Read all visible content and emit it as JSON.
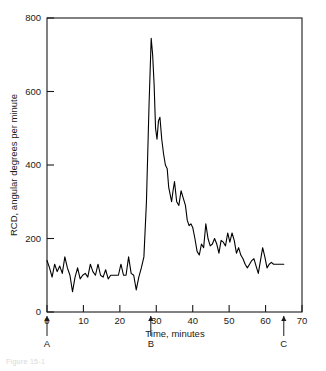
{
  "figure": {
    "caption_partial": "Figure 15-1"
  },
  "chart_data": {
    "type": "line",
    "title": "",
    "xlabel": "Time, minutes",
    "ylabel": "RCD, angular degrees per minute",
    "xlim": [
      0,
      70
    ],
    "ylim": [
      0,
      800
    ],
    "xticks": [
      0,
      10,
      20,
      30,
      40,
      50,
      60,
      70
    ],
    "yticks": [
      0,
      200,
      400,
      600,
      800
    ],
    "grid": false,
    "legend": null,
    "series": [
      {
        "name": "RCD",
        "x": [
          0.0,
          0.7,
          1.4,
          2.1,
          2.8,
          3.5,
          4.2,
          4.9,
          5.6,
          6.3,
          7.0,
          7.7,
          8.4,
          9.1,
          9.8,
          10.5,
          11.2,
          11.9,
          12.6,
          13.3,
          14.0,
          14.7,
          15.4,
          16.1,
          16.8,
          17.5,
          18.2,
          18.9,
          19.6,
          20.3,
          21.0,
          21.7,
          22.4,
          23.1,
          23.8,
          24.5,
          25.2,
          25.9,
          26.6,
          27.3,
          28.0,
          28.6,
          29.0,
          29.4,
          29.8,
          30.2,
          30.6,
          31.0,
          31.5,
          32.0,
          32.5,
          33.0,
          33.4,
          33.8,
          34.2,
          34.6,
          35.0,
          35.6,
          36.2,
          36.8,
          37.4,
          38.0,
          38.5,
          39.0,
          39.5,
          40.0,
          40.6,
          41.2,
          41.8,
          42.4,
          43.0,
          43.6,
          44.2,
          44.8,
          45.4,
          46.0,
          46.6,
          47.2,
          47.8,
          48.4,
          49.0,
          49.6,
          50.2,
          50.8,
          51.4,
          52.0,
          52.6,
          53.2,
          53.8,
          54.4,
          55.0,
          55.6,
          56.2,
          56.8,
          57.4,
          58.0,
          58.6,
          59.2,
          59.8,
          60.4,
          61.0,
          61.6,
          62.2,
          62.8,
          63.4,
          64.0,
          64.6,
          65.0
        ],
        "y": [
          140,
          120,
          95,
          130,
          110,
          125,
          105,
          150,
          120,
          100,
          55,
          95,
          120,
          90,
          100,
          105,
          95,
          130,
          110,
          100,
          130,
          100,
          95,
          115,
          90,
          100,
          100,
          100,
          100,
          130,
          100,
          100,
          150,
          105,
          100,
          60,
          95,
          120,
          150,
          300,
          560,
          745,
          700,
          620,
          500,
          470,
          520,
          530,
          470,
          430,
          400,
          390,
          340,
          320,
          300,
          330,
          355,
          300,
          290,
          330,
          310,
          290,
          250,
          235,
          240,
          230,
          200,
          165,
          155,
          185,
          175,
          240,
          200,
          180,
          185,
          200,
          185,
          160,
          195,
          190,
          180,
          215,
          190,
          215,
          195,
          160,
          175,
          155,
          145,
          130,
          120,
          130,
          140,
          145,
          125,
          105,
          140,
          175,
          150,
          120,
          130,
          135,
          130,
          130,
          130,
          130,
          130,
          130
        ],
        "color": "#000000",
        "peak_value": 745,
        "peak_time": 31.0,
        "baseline_value": 110
      }
    ],
    "annotations": [
      {
        "label": "A",
        "x": 0,
        "type": "arrow-up-marker"
      },
      {
        "label": "B",
        "x": 28.5,
        "type": "arrow-up-marker"
      },
      {
        "label": "C",
        "x": 65,
        "type": "arrow-up-marker"
      }
    ]
  }
}
